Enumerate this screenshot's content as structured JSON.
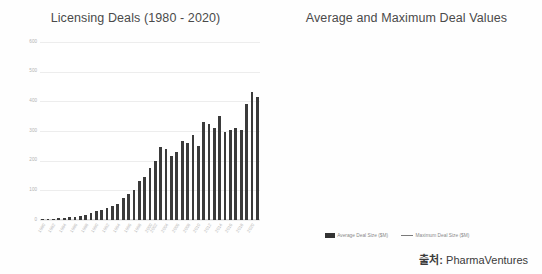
{
  "source": {
    "label": "출처:",
    "value": "PharmaVentures"
  },
  "legend": {
    "average": "Average Deal Size ($M)",
    "maximum": "Maximum Deal Size ($M)"
  },
  "colors": {
    "bar": "#3b3b3b",
    "line": "#8a8a8a",
    "grid": "#ededed",
    "title": "#4a4a4a",
    "tick": "#b3b3b3",
    "background": "#ffffff"
  },
  "chart_data": [
    {
      "type": "bar",
      "title": "Licensing Deals (1980 - 2020)",
      "xlabel": "",
      "ylabel": "",
      "ylim": [
        0,
        600
      ],
      "yticks": [
        0,
        100,
        200,
        300,
        400,
        500,
        600
      ],
      "grid": true,
      "legend_position": "none",
      "categories": [
        "1980",
        "1981",
        "1982",
        "1983",
        "1984",
        "1985",
        "1986",
        "1987",
        "1988",
        "1989",
        "1990",
        "1991",
        "1992",
        "1993",
        "1994",
        "1995",
        "1996",
        "1997",
        "1998",
        "1999",
        "2000",
        "2001",
        "2002",
        "2003",
        "2004",
        "2005",
        "2006",
        "2007",
        "2008",
        "2009",
        "2010",
        "2011",
        "2012",
        "2013",
        "2014",
        "2015",
        "2016",
        "2017",
        "2018",
        "2019",
        "2020"
      ],
      "values": [
        3,
        4,
        5,
        6,
        7,
        9,
        11,
        13,
        16,
        22,
        30,
        35,
        40,
        46,
        55,
        75,
        88,
        100,
        130,
        145,
        175,
        200,
        245,
        240,
        215,
        230,
        265,
        260,
        285,
        250,
        330,
        325,
        310,
        350,
        295,
        305,
        310,
        305,
        390,
        430,
        415
      ],
      "series_name": "Number of Licensing Deals"
    },
    {
      "type": "bar-line-combo",
      "title": "Average and Maximum Deal Values",
      "xlabel": "",
      "grid": true,
      "legend_position": "bottom",
      "y_left": {
        "label": "Average Deal Size ($M)",
        "lim": [
          0,
          450
        ],
        "ticks": [
          0,
          50,
          100,
          150,
          200,
          250,
          300,
          350,
          400,
          450
        ]
      },
      "y_right": {
        "label": "Maximum Deal Size ($M)",
        "lim": [
          0,
          8000
        ],
        "ticks": [
          0,
          1000,
          2000,
          3000,
          4000,
          5000,
          6000,
          7000,
          8000
        ]
      },
      "categories": [
        "1980",
        "1982",
        "1984",
        "1986",
        "1988",
        "1990",
        "1992",
        "1994",
        "1996",
        "1998",
        "2000",
        "2002",
        "2004",
        "2006",
        "2008",
        "2010",
        "2012",
        "2014",
        "2016",
        "2018",
        "2020"
      ],
      "xtick_labels": [
        "1980",
        "1982",
        "1984",
        "1986",
        "1988",
        "1990",
        "1992",
        "1994",
        "1996",
        "1998",
        "2000",
        "2002",
        "2004",
        "2006",
        "2008",
        "2010",
        "2012",
        "2014",
        "2016",
        "2018",
        "2020"
      ],
      "series": [
        {
          "name": "Average Deal Size ($M)",
          "axis": "left",
          "type": "bar",
          "values": [
            4,
            2,
            68,
            3,
            5,
            26,
            18,
            32,
            30,
            22,
            16,
            8,
            6,
            34,
            28,
            35,
            44,
            40,
            28,
            38,
            33,
            55,
            66,
            72,
            78,
            105,
            95,
            100,
            120,
            82,
            140,
            95,
            104,
            425,
            128,
            165,
            88,
            60,
            220,
            112,
            265,
            145,
            375,
            420
          ]
        },
        {
          "name": "Maximum Deal Size ($M)",
          "axis": "right",
          "type": "line",
          "values": [
            30,
            25,
            40,
            35,
            45,
            120,
            140,
            160,
            180,
            150,
            130,
            110,
            120,
            200,
            230,
            280,
            330,
            300,
            270,
            380,
            420,
            560,
            700,
            900,
            1250,
            1450,
            1100,
            980,
            1200,
            900,
            1450,
            1050,
            1200,
            2150,
            1350,
            1900,
            1100,
            850,
            1200,
            1050,
            1600,
            3300,
            6800,
            5900
          ]
        }
      ]
    }
  ]
}
